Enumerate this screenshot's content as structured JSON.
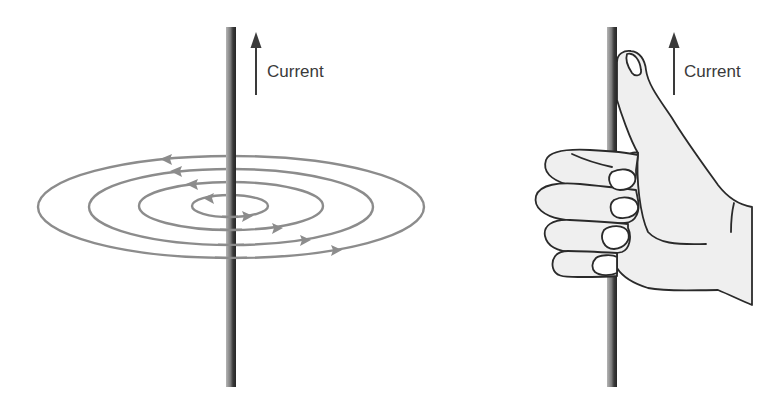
{
  "figure": {
    "colors": {
      "background": "#ffffff",
      "wire_dark": "#2e2e2e",
      "wire_light": "#9a9a9a",
      "field_lines": "#8a8a8a",
      "arrow": "#3a3a3a",
      "hand_fill": "#efefef",
      "hand_outline": "#2a2a2a"
    },
    "left_panel": {
      "name": "field-lines-diagram",
      "current_label": "Current",
      "current_direction": "up",
      "field_loops": 4,
      "field_direction": "counterclockwise (viewed from above)"
    },
    "right_panel": {
      "name": "right-hand-grip-rule",
      "current_label": "Current",
      "current_direction": "up",
      "thumb_direction": "up",
      "fingers_curl": "around wire"
    }
  }
}
